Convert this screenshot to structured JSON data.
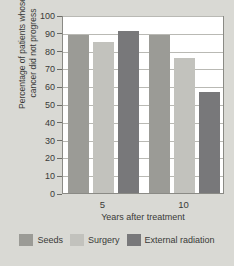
{
  "chart_data": {
    "type": "bar",
    "title": "",
    "xlabel": "Years after treatment",
    "ylabel": "Percentage of patients whose cancer did not progress",
    "ylabel_line1": "Percentage of patients whose",
    "ylabel_line2": "cancer did not progress",
    "categories": [
      "5",
      "10"
    ],
    "series": [
      {
        "name": "Seeds",
        "color": "#9b9b96",
        "values": [
          89,
          89
        ]
      },
      {
        "name": "Surgery",
        "color": "#c2c2bd",
        "values": [
          85,
          76
        ]
      },
      {
        "name": "External radiation",
        "color": "#78787a",
        "values": [
          91,
          57
        ]
      }
    ],
    "ylim": [
      0,
      100
    ],
    "yticks": [
      0,
      10,
      20,
      30,
      40,
      50,
      60,
      70,
      80,
      90,
      100
    ],
    "ytick_labels": [
      "0",
      "10",
      "20",
      "30",
      "40",
      "50",
      "60",
      "70",
      "80",
      "90",
      "100"
    ],
    "grid": true,
    "legend_position": "bottom"
  },
  "legend": {
    "items": [
      {
        "label": "Seeds",
        "color": "#9b9b96"
      },
      {
        "label": "Surgery",
        "color": "#c2c2bd"
      },
      {
        "label": "External radiation",
        "color": "#78787a"
      }
    ]
  },
  "colors": {
    "background": "#d9d9d4",
    "plot_background": "#ffffff",
    "gridline": "#b9b9b4",
    "axis": "#8a8a85",
    "text": "#3a3a38"
  }
}
